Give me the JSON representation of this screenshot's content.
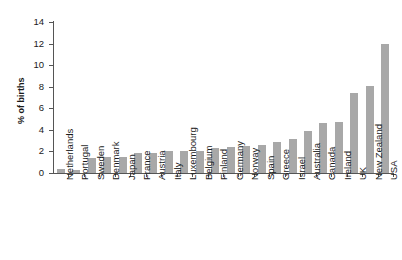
{
  "chart_data": {
    "type": "bar",
    "title": "",
    "xlabel": "",
    "ylabel": "% of births",
    "ylim": [
      0,
      14
    ],
    "yticks": [
      0,
      2,
      4,
      6,
      8,
      10,
      12,
      14
    ],
    "ytick_labels": [
      "0",
      "2",
      "4",
      "6",
      "8",
      "10",
      "12",
      "14"
    ],
    "grid": false,
    "legend": "none",
    "bar_color": "#a8a8a8",
    "axis_color": "#555555",
    "categories": [
      "Netherlands",
      "Portugal",
      "Sweden",
      "Denmark",
      "Japan",
      "France",
      "Austria",
      "Italy",
      "Luxembourg",
      "Belgium",
      "Finland",
      "Germany",
      "Norway",
      "Spain",
      "Greece",
      "Israel",
      "Australia",
      "Canada",
      "Ireland",
      "UK",
      "New Zealand",
      "USA"
    ],
    "values": [
      0.4,
      0.3,
      1.4,
      1.5,
      1.5,
      1.9,
      1.9,
      2.0,
      2.0,
      2.0,
      2.3,
      2.4,
      2.5,
      2.6,
      2.9,
      3.2,
      3.9,
      4.6,
      4.7,
      7.4,
      8.1,
      12.0
    ]
  }
}
